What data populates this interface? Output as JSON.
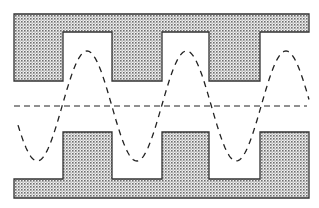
{
  "diagram": {
    "colors": {
      "background": "#ffffff",
      "outline": "#333333",
      "stipple_dot": "#6e6e6e",
      "stipple_bg": "#f2f2f2",
      "dash": "#222222"
    },
    "top_plate": {
      "outline_points": "14,14 309,14 309,32 260,32 260,81 209,81 209,32 162,32 162,81 112,81 112,32 63,32 63,81 14,81"
    },
    "bottom_plate": {
      "outline_points": "14,198 309,198 309,132 260,132 260,179 209,179 209,132 162,132 162,179 112,179 112,132 63,132 63,179 14,179"
    },
    "centerline": {
      "x1": 14,
      "x2": 307,
      "y": 106
    },
    "wave": {
      "center_y": 106,
      "amplitude": 55,
      "period": 99.5,
      "start_x": 18,
      "end_x": 309,
      "peaks_x": [
        87,
        186,
        285
      ],
      "troughs_x": [
        36,
        136,
        235
      ]
    }
  }
}
